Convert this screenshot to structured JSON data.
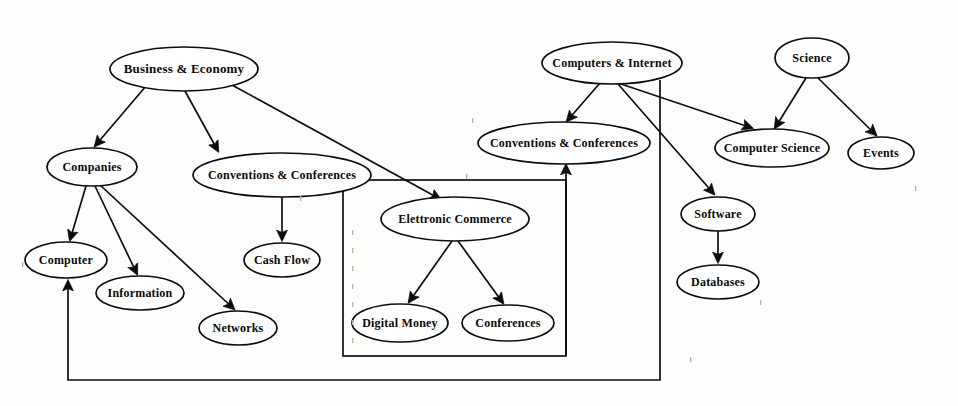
{
  "diagram": {
    "background_color": "#fdfdfb",
    "stroke_color": "#0d0d0d",
    "node_fill_color": "#ffffff",
    "nodes": [
      {
        "id": "business_economy",
        "label": "Business & Economy",
        "cx": 184,
        "cy": 69,
        "rx": 74,
        "ry": 22,
        "font_size": 13
      },
      {
        "id": "companies",
        "label": "Companies",
        "cx": 92,
        "cy": 167,
        "rx": 45,
        "ry": 19,
        "font_size": 12
      },
      {
        "id": "conventions_left",
        "label": "Conventions & Conferences",
        "cx": 282,
        "cy": 175,
        "rx": 89,
        "ry": 22,
        "font_size": 12
      },
      {
        "id": "computer",
        "label": "Computer",
        "cx": 66,
        "cy": 260,
        "rx": 41,
        "ry": 18,
        "font_size": 12
      },
      {
        "id": "information",
        "label": "Information",
        "cx": 140,
        "cy": 293,
        "rx": 44,
        "ry": 17,
        "font_size": 12
      },
      {
        "id": "networks",
        "label": "Networks",
        "cx": 238,
        "cy": 328,
        "rx": 39,
        "ry": 17,
        "font_size": 12
      },
      {
        "id": "cash_flow",
        "label": "Cash Flow",
        "cx": 282,
        "cy": 260,
        "rx": 38,
        "ry": 17,
        "font_size": 12
      },
      {
        "id": "electronic_commerce",
        "label": "Elettronic Commerce",
        "cx": 455,
        "cy": 219,
        "rx": 74,
        "ry": 22,
        "font_size": 12
      },
      {
        "id": "digital_money",
        "label": "Digital Money",
        "cx": 400,
        "cy": 323,
        "rx": 48,
        "ry": 19,
        "font_size": 12
      },
      {
        "id": "conferences",
        "label": "Conferences",
        "cx": 508,
        "cy": 323,
        "rx": 46,
        "ry": 18,
        "font_size": 12
      },
      {
        "id": "computers_internet",
        "label": "Computers & Internet",
        "cx": 612,
        "cy": 63,
        "rx": 70,
        "ry": 21,
        "font_size": 12
      },
      {
        "id": "conventions_right",
        "label": "Conventions & Conferences",
        "cx": 564,
        "cy": 143,
        "rx": 86,
        "ry": 21,
        "font_size": 12
      },
      {
        "id": "computer_science",
        "label": "Computer Science",
        "cx": 772,
        "cy": 148,
        "rx": 57,
        "ry": 19,
        "font_size": 12
      },
      {
        "id": "software",
        "label": "Software",
        "cx": 718,
        "cy": 214,
        "rx": 37,
        "ry": 17,
        "font_size": 12
      },
      {
        "id": "databases",
        "label": "Databases",
        "cx": 718,
        "cy": 282,
        "rx": 41,
        "ry": 17,
        "font_size": 12
      },
      {
        "id": "science",
        "label": "Science",
        "cx": 812,
        "cy": 58,
        "rx": 37,
        "ry": 20,
        "font_size": 12
      },
      {
        "id": "events",
        "label": "Events",
        "cx": 881,
        "cy": 153,
        "rx": 33,
        "ry": 16,
        "font_size": 12
      }
    ],
    "edges": [
      {
        "id": "be-companies",
        "from": "business_economy",
        "to": "companies",
        "path": "M 146 86 L 95 146",
        "arrow": true
      },
      {
        "id": "be-conventions",
        "from": "business_economy",
        "to": "conventions_left",
        "path": "M 185 91 L 218 151",
        "arrow": true
      },
      {
        "id": "be-ecommerce",
        "from": "business_economy",
        "to": "electronic_commerce",
        "path": "M 232 85 L 440 199",
        "arrow": true
      },
      {
        "id": "companies-computer",
        "from": "companies",
        "to": "computer",
        "path": "M 86 186 L 70 240",
        "arrow": true
      },
      {
        "id": "companies-info",
        "from": "companies",
        "to": "information",
        "path": "M 95 186 L 137 274",
        "arrow": true
      },
      {
        "id": "companies-networks",
        "from": "companies",
        "to": "networks",
        "path": "M 100 185 L 234 309",
        "arrow": true
      },
      {
        "id": "conv-cashflow",
        "from": "conventions_left",
        "to": "cash_flow",
        "path": "M 282 197 L 282 240",
        "arrow": true
      },
      {
        "id": "ec-digitalmoney",
        "from": "electronic_commerce",
        "to": "digital_money",
        "path": "M 452 241 L 409 302",
        "arrow": true
      },
      {
        "id": "ec-conferences",
        "from": "electronic_commerce",
        "to": "conferences",
        "path": "M 458 241 L 503 303",
        "arrow": true
      },
      {
        "id": "ci-conventions",
        "from": "computers_internet",
        "to": "conventions_right",
        "path": "M 600 83 L 567 121",
        "arrow": true
      },
      {
        "id": "ci-compsci",
        "from": "computers_internet",
        "to": "computer_science",
        "path": "M 618 83 L 752 128",
        "arrow": true
      },
      {
        "id": "ci-software",
        "from": "computers_internet",
        "to": "software",
        "path": "M 618 84 L 714 194",
        "arrow": true
      },
      {
        "id": "software-databases",
        "from": "software",
        "to": "databases",
        "path": "M 718 231 L 718 262",
        "arrow": true
      },
      {
        "id": "science-compsci",
        "from": "science",
        "to": "computer_science",
        "path": "M 806 78 L 775 128",
        "arrow": true
      },
      {
        "id": "science-events",
        "from": "science",
        "to": "events",
        "path": "M 818 78 L 876 135",
        "arrow": true
      },
      {
        "id": "ecgroup-conventions",
        "from": "electronic_commerce_group",
        "to": "conventions_right",
        "path": "M 566 356 L 566 165",
        "arrow": true
      },
      {
        "id": "ci-computer-return",
        "from": "computers_internet",
        "to": "computer",
        "path": "M 660 80 L 660 380 L 68 380 L 68 281",
        "arrow": true
      }
    ],
    "group_box": {
      "id": "electronic_commerce_group",
      "label": "",
      "x": 343,
      "y": 180,
      "width": 223,
      "height": 176
    },
    "node_count": 17,
    "edge_count": 17
  }
}
